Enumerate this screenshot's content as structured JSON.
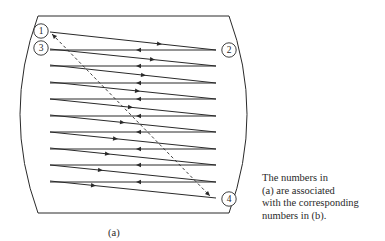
{
  "figure": {
    "sub_label": "(a)",
    "caption_lines": [
      "The numbers in",
      "(a) are associated",
      "with the corresponding",
      "numbers in (b)."
    ],
    "points": [
      {
        "label": "1",
        "cx": 41,
        "cy": 31
      },
      {
        "label": "2",
        "cx": 229,
        "cy": 50
      },
      {
        "label": "3",
        "cx": 41,
        "cy": 48
      },
      {
        "label": "4",
        "cx": 229,
        "cy": 199
      }
    ],
    "scan_lines": {
      "count": 10,
      "left_x": 50,
      "right_x": 216,
      "left_y": [
        32,
        49,
        65,
        82,
        99,
        115,
        132,
        148,
        165,
        181
      ],
      "right_y": [
        50,
        66,
        83,
        99,
        116,
        132,
        149,
        165,
        182,
        198
      ],
      "forward_arrow_x": [
        162,
        155,
        146,
        140,
        133,
        125,
        118,
        110,
        103,
        96
      ],
      "return_arrow_x": 136
    },
    "retrace": {
      "from": [
        52,
        34
      ],
      "to": [
        210,
        196
      ],
      "style": "dashed"
    },
    "colors": {
      "line": "#2a2a2a",
      "background": "#ffffff"
    }
  }
}
